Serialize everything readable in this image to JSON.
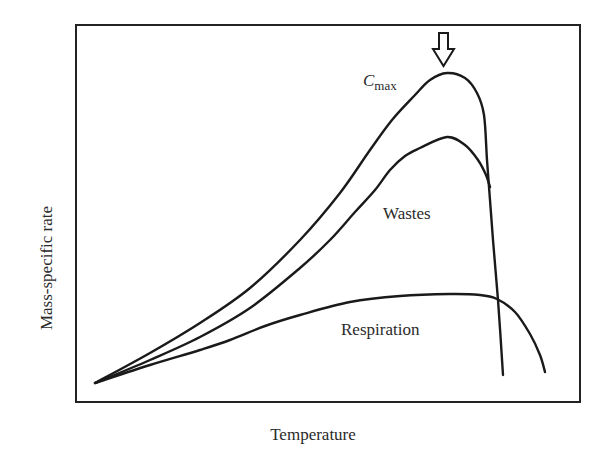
{
  "chart_data": {
    "type": "line",
    "title": "",
    "xlabel": "Temperature",
    "ylabel": "Mass-specific rate",
    "grid": false,
    "legend": "none (curves labeled inline)",
    "axis_ticks": "none",
    "series": [
      {
        "name": "Cmax",
        "label_main": "C",
        "label_sub": "max",
        "description": "Maximum consumption rate; rises with temperature to a peak (marked by arrow) then drops sharply",
        "points": [
          [
            95,
            383
          ],
          [
            150,
            353
          ],
          [
            200,
            323
          ],
          [
            250,
            288
          ],
          [
            300,
            240
          ],
          [
            340,
            193
          ],
          [
            370,
            150
          ],
          [
            392,
            120
          ],
          [
            415,
            95
          ],
          [
            430,
            80
          ],
          [
            447,
            73
          ],
          [
            465,
            78
          ],
          [
            477,
            93
          ],
          [
            484,
            115
          ],
          [
            487,
            160
          ],
          [
            490,
            200
          ],
          [
            493,
            240
          ],
          [
            498,
            300
          ],
          [
            503,
            375
          ]
        ]
      },
      {
        "name": "Wastes",
        "label_main": "Wastes",
        "description": "Waste losses; peaks slightly lower than Cmax and joins the Cmax curve on the descent",
        "points": [
          [
            95,
            383
          ],
          [
            150,
            360
          ],
          [
            200,
            337
          ],
          [
            250,
            308
          ],
          [
            300,
            268
          ],
          [
            330,
            240
          ],
          [
            355,
            212
          ],
          [
            375,
            190
          ],
          [
            390,
            170
          ],
          [
            405,
            156
          ],
          [
            420,
            148
          ],
          [
            447,
            137
          ],
          [
            465,
            145
          ],
          [
            478,
            160
          ],
          [
            486,
            175
          ],
          [
            490,
            187
          ]
        ]
      },
      {
        "name": "Respiration",
        "label_main": "Respiration",
        "description": "Respiration rate; rises slowly, plateaus, then declines at high temperature",
        "points": [
          [
            95,
            383
          ],
          [
            150,
            365
          ],
          [
            200,
            350
          ],
          [
            230,
            340
          ],
          [
            265,
            326
          ],
          [
            300,
            315
          ],
          [
            350,
            302
          ],
          [
            400,
            296
          ],
          [
            450,
            294
          ],
          [
            480,
            295
          ],
          [
            497,
            299
          ],
          [
            515,
            312
          ],
          [
            530,
            334
          ],
          [
            540,
            355
          ],
          [
            545,
            372
          ]
        ]
      }
    ],
    "annotations": [
      {
        "type": "hollow-down-arrow",
        "target": "Cmax peak",
        "x": 443,
        "y_top": 33,
        "y_tip": 66
      }
    ]
  },
  "labels": {
    "xlabel": "Temperature",
    "ylabel": "Mass-specific rate",
    "cmax_main": "C",
    "cmax_sub": "max",
    "wastes": "Wastes",
    "respiration": "Respiration"
  }
}
